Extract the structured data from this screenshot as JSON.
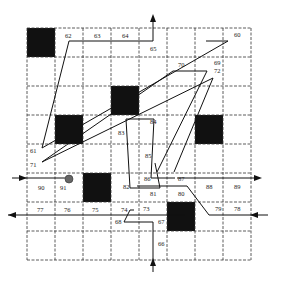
{
  "grid": {
    "x0": 27,
    "y0": 28,
    "cols": 8,
    "rows": 8,
    "cell_w": 28,
    "cell_h": 29,
    "line_color": "#333333",
    "blocked_color": "#111111",
    "blocked_cells": [
      [
        0,
        0
      ],
      [
        3,
        2
      ],
      [
        1,
        3
      ],
      [
        6,
        3
      ],
      [
        2,
        5
      ],
      [
        5,
        6
      ]
    ]
  },
  "labels": [
    {
      "text": "62",
      "x": 65,
      "y": 38
    },
    {
      "text": "63",
      "x": 94,
      "y": 38
    },
    {
      "text": "64",
      "x": 122,
      "y": 38
    },
    {
      "text": "65",
      "x": 150,
      "y": 51
    },
    {
      "text": "60",
      "x": 234,
      "y": 37
    },
    {
      "text": "70",
      "x": 178,
      "y": 67
    },
    {
      "text": "69",
      "x": 214,
      "y": 65
    },
    {
      "text": "72",
      "x": 214,
      "y": 73
    },
    {
      "text": "84",
      "x": 150,
      "y": 124
    },
    {
      "text": "83",
      "x": 118,
      "y": 135
    },
    {
      "text": "61",
      "x": 30,
      "y": 153
    },
    {
      "text": "71",
      "x": 30,
      "y": 167
    },
    {
      "text": "85",
      "x": 145,
      "y": 158
    },
    {
      "text": "86",
      "x": 144,
      "y": 181
    },
    {
      "text": "87",
      "x": 178,
      "y": 181
    },
    {
      "text": "90",
      "x": 38,
      "y": 190
    },
    {
      "text": "91",
      "x": 60,
      "y": 190
    },
    {
      "text": "82",
      "x": 123,
      "y": 189
    },
    {
      "text": "88",
      "x": 206,
      "y": 189
    },
    {
      "text": "89",
      "x": 234,
      "y": 189
    },
    {
      "text": "81",
      "x": 150,
      "y": 196
    },
    {
      "text": "80",
      "x": 178,
      "y": 196
    },
    {
      "text": "77",
      "x": 37,
      "y": 212
    },
    {
      "text": "76",
      "x": 64,
      "y": 212
    },
    {
      "text": "75",
      "x": 92,
      "y": 212
    },
    {
      "text": "74",
      "x": 121,
      "y": 212
    },
    {
      "text": "73",
      "x": 143,
      "y": 211
    },
    {
      "text": "79",
      "x": 215,
      "y": 211
    },
    {
      "text": "78",
      "x": 234,
      "y": 211
    },
    {
      "text": "68",
      "x": 115,
      "y": 224
    },
    {
      "text": "67",
      "x": 158,
      "y": 224
    },
    {
      "text": "66",
      "x": 158,
      "y": 246
    }
  ],
  "paths": [
    {
      "name": "path-main-zigzag",
      "points": "153,41 69,41 42,148 228,41 206,41"
    },
    {
      "name": "path-upper-loop",
      "points": "42,162 173,71 207,71 157,172"
    },
    {
      "name": "path-72-loop",
      "points": "42,162 213,78 174,172"
    },
    {
      "name": "path-center-box",
      "points": "126,119 154,119 151,178 164,178 175,178"
    },
    {
      "name": "path-83-box",
      "points": "126,119 130,188 160,188 155,163"
    },
    {
      "name": "path-lower-right",
      "points": "134,210 130,210 124,222 148,222 153,222 153,272"
    },
    {
      "name": "path-exit-left",
      "points": "8,215 185,215"
    },
    {
      "name": "path-80-route",
      "points": "137,186 187,186 209,215 255,215"
    },
    {
      "name": "path-entry-top-right",
      "points": "177,178 256,178"
    }
  ],
  "arrows": [
    {
      "name": "arrow-up-top",
      "x": 153,
      "y": 14,
      "dir": "up"
    },
    {
      "name": "arrow-up-bottom",
      "x": 153,
      "y": 258,
      "dir": "up"
    },
    {
      "name": "arrow-right-entry",
      "x": 27,
      "y": 178,
      "dir": "right"
    },
    {
      "name": "arrow-left-exit",
      "x": 8,
      "y": 215,
      "dir": "left"
    },
    {
      "name": "arrow-right-exit",
      "x": 262,
      "y": 178,
      "dir": "right"
    },
    {
      "name": "arrow-left-entry",
      "x": 250,
      "y": 215,
      "dir": "left"
    }
  ],
  "marker": {
    "name": "robot-position",
    "x": 69,
    "y": 179,
    "r": 4,
    "color": "#666666"
  }
}
